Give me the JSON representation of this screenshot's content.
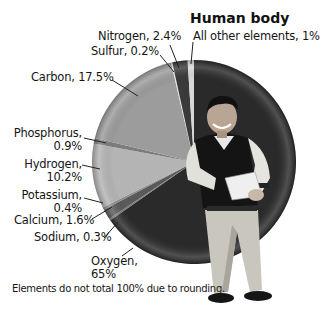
{
  "chart_data": {
    "type": "pie",
    "title": "Human body",
    "start_angle_deg": 0,
    "direction": "clockwise",
    "slices": [
      {
        "label": "Oxygen",
        "value": 65,
        "display": "65%",
        "color": "#2a2a2a"
      },
      {
        "label": "Sodium",
        "value": 0.3,
        "display": "0.3%",
        "color": "#7a7a7a"
      },
      {
        "label": "Calcium",
        "value": 1.6,
        "display": "1.6%",
        "color": "#5a5a5a"
      },
      {
        "label": "Potassium",
        "value": 0.4,
        "display": "0.4%",
        "color": "#8a8a8a"
      },
      {
        "label": "Hydrogen",
        "value": 10.2,
        "display": "10.2%",
        "color": "#b4b4b4"
      },
      {
        "label": "Phosphorus",
        "value": 0.9,
        "display": "0.9%",
        "color": "#7c7c7c"
      },
      {
        "label": "Carbon",
        "value": 17.5,
        "display": "17.5%",
        "color": "#9c9c9c"
      },
      {
        "label": "Sulfur",
        "value": 0.2,
        "display": "0.2%",
        "color": "#e6e6e6"
      },
      {
        "label": "Nitrogen",
        "value": 2.4,
        "display": "2.4%",
        "color": "#3a3a3a"
      },
      {
        "label": "All other elements",
        "value": 1,
        "display": "1%",
        "color": "#d8d8d8"
      }
    ],
    "footnote": "Elements do not total 100% due to rounding."
  },
  "labels": {
    "title": "Human body",
    "nitrogen": "Nitrogen, 2.4%",
    "sulfur": "Sulfur, 0.2%",
    "all_other": "All other elements, 1%",
    "carbon": "Carbon, 17.5%",
    "phosphorus_1": "Phosphorus,",
    "phosphorus_2": "0.9%",
    "hydrogen_1": "Hydrogen,",
    "hydrogen_2": "10.2%",
    "potassium_1": "Potassium,",
    "potassium_2": "0.4%",
    "calcium": "Calcium, 1.6%",
    "sodium": "Sodium, 0.3%",
    "oxygen_1": "Oxygen,",
    "oxygen_2": "65%",
    "footnote": "Elements do not total 100% due to rounding."
  }
}
